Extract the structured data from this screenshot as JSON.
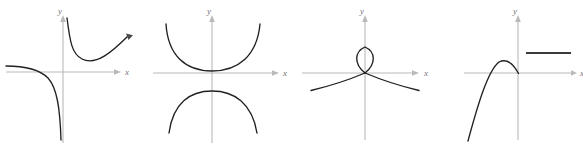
{
  "figure": {
    "panel_count": 4,
    "background_color": "#ffffff",
    "curve_color": "#231f20",
    "axis_color": "#b9b9bb",
    "label_color": "#76757a"
  },
  "panels": [
    {
      "id": "panel-a",
      "name": "rectangular-hyperbola-reciprocal",
      "x_axis_label": "x",
      "y_axis_label": "y",
      "description": "Reciprocal-type curve: upper-right branch falling from the y-axis to a minimum then rising; lower-left branch asymptotic to the negative x-axis and falling along the y-axis",
      "origin": {
        "x": 63,
        "y": 72
      },
      "has_x_arrow": true,
      "has_y_arrow": true,
      "branches": [
        {
          "name": "upper-right-branch",
          "path": "M 67,18 C 70,42 72,54 82,59 C 96,66 112,52 128,36"
        },
        {
          "name": "lower-left-branch",
          "path": "M 6,66 C 22,66 38,68 48,78 C 57,88 60,108 61,140"
        }
      ]
    },
    {
      "id": "panel-b",
      "name": "vertical-hyperbola-two-branches",
      "x_axis_label": "x",
      "y_axis_label": "y",
      "description": "Two opposing branches: an upper wide U opening upward with vertex just above the x-axis, and a lower inverted U opening downward",
      "origin": {
        "x": 212,
        "y": 73
      },
      "has_x_arrow": true,
      "has_y_arrow": true,
      "branches": [
        {
          "name": "upper-branch",
          "path": "M 166,24 C 168,56 186,71 212,71 C 238,71 257,56 260,24"
        },
        {
          "name": "lower-branch",
          "path": "M 169,133 C 173,103 190,91 212,91 C 234,91 252,103 257,133"
        }
      ]
    },
    {
      "id": "panel-c",
      "name": "folium-loop-curve",
      "x_axis_label": "x",
      "y_axis_label": "y",
      "description": "Self-intersecting curve with a narrow teardrop loop above the origin and two branches sweeping down and outward from the crossing point",
      "origin": {
        "x": 365,
        "y": 73
      },
      "has_x_arrow": true,
      "has_y_arrow": true,
      "branches": [
        {
          "name": "loop",
          "path": "M 365,73 C 354,64 355,51 365,47 C 375,51 376,64 365,73"
        },
        {
          "name": "left-branch",
          "path": "M 365,73 C 352,78 336,84 311,90"
        },
        {
          "name": "right-branch",
          "path": "M 365,73 C 378,78 394,84 419,90"
        }
      ]
    },
    {
      "id": "panel-d",
      "name": "cubic-arc-with-horizontal-segment",
      "x_axis_label": "x",
      "y_axis_label": "y",
      "description": "Arc rising steeply from lower left to a maximum just left of the y-axis, then descending to cross the x-axis at the origin; a separate horizontal segment sits in the first quadrant",
      "origin": {
        "x": 518,
        "y": 73
      },
      "has_x_arrow": true,
      "has_y_arrow": true,
      "branches": [
        {
          "name": "arc-branch",
          "path": "M 468,140 C 478,104 488,70 499,62 C 508,58 514,66 518,73"
        },
        {
          "name": "horizontal-segment",
          "path": "M 526,53 L 571,53"
        }
      ]
    }
  ]
}
